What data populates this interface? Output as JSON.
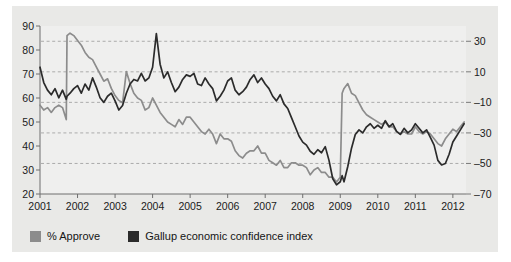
{
  "chart_data": {
    "type": "line",
    "title": "",
    "subtitle": "",
    "xlabel": "",
    "ylabel": "",
    "grid": true,
    "legend_position": "bottom-left",
    "x": [
      2001.0,
      2001.1,
      2001.2,
      2001.3,
      2001.4,
      2001.5,
      2001.6,
      2001.7,
      2001.72,
      2001.8,
      2001.9,
      2002.0,
      2002.1,
      2002.2,
      2002.3,
      2002.4,
      2002.5,
      2002.6,
      2002.7,
      2002.8,
      2002.9,
      2003.0,
      2003.1,
      2003.2,
      2003.3,
      2003.4,
      2003.5,
      2003.6,
      2003.7,
      2003.8,
      2003.9,
      2004.0,
      2004.1,
      2004.2,
      2004.3,
      2004.4,
      2004.5,
      2004.6,
      2004.7,
      2004.8,
      2004.9,
      2005.0,
      2005.1,
      2005.2,
      2005.3,
      2005.4,
      2005.5,
      2005.6,
      2005.7,
      2005.8,
      2005.9,
      2006.0,
      2006.1,
      2006.2,
      2006.3,
      2006.4,
      2006.5,
      2006.6,
      2006.7,
      2006.8,
      2006.9,
      2007.0,
      2007.1,
      2007.2,
      2007.3,
      2007.4,
      2007.5,
      2007.6,
      2007.7,
      2007.8,
      2007.9,
      2008.0,
      2008.1,
      2008.2,
      2008.3,
      2008.4,
      2008.5,
      2008.6,
      2008.7,
      2008.8,
      2008.9,
      2009.0,
      2009.05,
      2009.1,
      2009.2,
      2009.3,
      2009.4,
      2009.5,
      2009.6,
      2009.7,
      2009.8,
      2009.9,
      2010.0,
      2010.1,
      2010.2,
      2010.3,
      2010.4,
      2010.5,
      2010.6,
      2010.7,
      2010.8,
      2010.9,
      2011.0,
      2011.1,
      2011.2,
      2011.3,
      2011.4,
      2011.5,
      2011.6,
      2011.7,
      2011.8,
      2011.9,
      2012.0,
      2012.1,
      2012.2,
      2012.3
    ],
    "axes": {
      "x": {
        "range": [
          2001,
          2012.35
        ],
        "ticks": [
          2001,
          2002,
          2003,
          2004,
          2005,
          2006,
          2007,
          2008,
          2009,
          2010,
          2011,
          2012
        ],
        "tick_labels": [
          "2001",
          "2002",
          "2003",
          "2004",
          "2005",
          "2006",
          "2007",
          "2008",
          "2009",
          "2010",
          "2011",
          "2012"
        ]
      },
      "y_left": {
        "range": [
          20,
          90
        ],
        "ticks": [
          20,
          30,
          40,
          50,
          60,
          70,
          80,
          90
        ],
        "tick_labels": [
          "20",
          "30",
          "40",
          "50",
          "60",
          "70",
          "80",
          "90"
        ],
        "label": "% Approve"
      },
      "y_right": {
        "range": [
          -70,
          40
        ],
        "ticks": [
          -70,
          -50,
          -30,
          -10,
          10,
          30
        ],
        "tick_labels": [
          "–70",
          "–50",
          "–30",
          "–10",
          "10",
          "30"
        ],
        "label": "Gallup economic confidence index"
      }
    },
    "series": [
      {
        "name": "% Approve",
        "axis": "left",
        "color": "#8c8c8c",
        "values": [
          57,
          55,
          56,
          54,
          56,
          57,
          56,
          51,
          86,
          87,
          86,
          84,
          82,
          79,
          77,
          76,
          73,
          70,
          67,
          68,
          64,
          61,
          59,
          58,
          71,
          66,
          62,
          60,
          59,
          55,
          56,
          60,
          57,
          54,
          52,
          50,
          49,
          48,
          51,
          49,
          52,
          52,
          50,
          48,
          46,
          45,
          47,
          45,
          41,
          45,
          43,
          43,
          42,
          38,
          36,
          35,
          37,
          38,
          38,
          40,
          37,
          37,
          34,
          33,
          32,
          34,
          31,
          31,
          33,
          33,
          32,
          32,
          31,
          28,
          30,
          31,
          29,
          29,
          27,
          27,
          25,
          27,
          62,
          64,
          66,
          62,
          61,
          58,
          55,
          53,
          52,
          51,
          50,
          49,
          50,
          48,
          48,
          46,
          45,
          46,
          45,
          45,
          48,
          46,
          45,
          46,
          45,
          43,
          41,
          40,
          43,
          45,
          47,
          46,
          48,
          50
        ]
      },
      {
        "name": "Gallup economic confidence index",
        "axis": "right",
        "color": "#2b2b2b",
        "values": [
          13,
          3,
          -2,
          -5,
          -1,
          -7,
          -2,
          -8,
          -6,
          -4,
          -1,
          1,
          -4,
          2,
          -2,
          6,
          0,
          -7,
          -10,
          -6,
          -4,
          -9,
          -15,
          -12,
          -4,
          2,
          5,
          4,
          9,
          4,
          6,
          13,
          35,
          15,
          6,
          10,
          3,
          -3,
          0,
          5,
          8,
          7,
          9,
          2,
          1,
          6,
          2,
          -1,
          -9,
          -6,
          -2,
          4,
          6,
          -2,
          -5,
          -3,
          0,
          5,
          8,
          3,
          6,
          2,
          -1,
          -6,
          -9,
          -5,
          -11,
          -14,
          -20,
          -26,
          -32,
          -36,
          -38,
          -42,
          -44,
          -41,
          -43,
          -39,
          -48,
          -60,
          -64,
          -62,
          -58,
          -62,
          -52,
          -40,
          -31,
          -28,
          -30,
          -26,
          -24,
          -27,
          -25,
          -27,
          -22,
          -26,
          -24,
          -29,
          -31,
          -27,
          -30,
          -28,
          -24,
          -27,
          -30,
          -28,
          -33,
          -38,
          -48,
          -51,
          -50,
          -44,
          -36,
          -32,
          -28,
          -24
        ]
      }
    ],
    "annotations": []
  },
  "legend": {
    "items": [
      {
        "label": "% Approve",
        "color": "#8c8c8c"
      },
      {
        "label": "Gallup economic confidence index",
        "color": "#2b2b2b"
      }
    ]
  }
}
